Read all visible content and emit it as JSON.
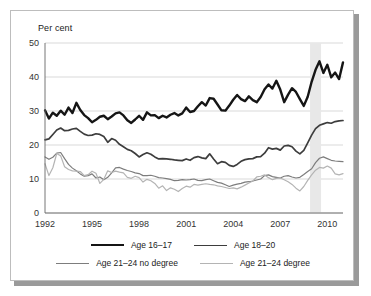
{
  "figure": {
    "axis_unit_label": "Per cent",
    "background_color": "#ffffff",
    "border_color": "#bdbdbd",
    "shadow_color": "#9a9a9a"
  },
  "legend": {
    "position": "bottom",
    "rows": [
      [
        {
          "label": "Age 16–17",
          "color": "#151515",
          "width": 2.4
        },
        {
          "label": "Age 18–20",
          "color": "#3d3d3d",
          "width": 1.7
        }
      ],
      [
        {
          "label": "Age 21–24 no degree",
          "color": "#7d7d7d",
          "width": 1.2
        },
        {
          "label": "Age 21–24 degree",
          "color": "#b4b4b4",
          "width": 1.2
        }
      ]
    ]
  },
  "chart_data": {
    "type": "line",
    "title": "",
    "subtitle": "",
    "xlabel": "",
    "ylabel": "Per cent",
    "ylim": [
      0,
      50
    ],
    "yticks": [
      0,
      10,
      20,
      30,
      40,
      50
    ],
    "xlim": [
      1992.0,
      2011.0
    ],
    "xticks": [
      1992,
      1995,
      1998,
      2001,
      2004,
      2007,
      2010
    ],
    "grid": true,
    "grid_color": "#c9c9c9",
    "legend_position": "bottom",
    "annotations": [
      {
        "type": "shaded-band",
        "name": "recession-band",
        "x_start": 2008.9,
        "x_end": 2009.6,
        "color": "#e8e8e8"
      }
    ],
    "x": [
      1992.0,
      1992.25,
      1992.5,
      1992.75,
      1993.0,
      1993.25,
      1993.5,
      1993.75,
      1994.0,
      1994.25,
      1994.5,
      1994.75,
      1995.0,
      1995.25,
      1995.5,
      1995.75,
      1996.0,
      1996.25,
      1996.5,
      1996.75,
      1997.0,
      1997.25,
      1997.5,
      1997.75,
      1998.0,
      1998.25,
      1998.5,
      1998.75,
      1999.0,
      1999.25,
      1999.5,
      1999.75,
      2000.0,
      2000.25,
      2000.5,
      2000.75,
      2001.0,
      2001.25,
      2001.5,
      2001.75,
      2002.0,
      2002.25,
      2002.5,
      2002.75,
      2003.0,
      2003.25,
      2003.5,
      2003.75,
      2004.0,
      2004.25,
      2004.5,
      2004.75,
      2005.0,
      2005.25,
      2005.5,
      2005.75,
      2006.0,
      2006.25,
      2006.5,
      2006.75,
      2007.0,
      2007.25,
      2007.5,
      2007.75,
      2008.0,
      2008.25,
      2008.5,
      2008.75,
      2009.0,
      2009.25,
      2009.5,
      2009.75,
      2010.0,
      2010.25,
      2010.5,
      2010.75,
      2011.0
    ],
    "series": [
      {
        "name": "Age 16–17",
        "color": "#151515",
        "width": 2.4,
        "values": [
          30.2,
          27.8,
          29.5,
          28.6,
          30.1,
          28.9,
          31.0,
          29.4,
          32.4,
          30.3,
          28.8,
          27.9,
          26.7,
          27.4,
          28.3,
          28.6,
          27.6,
          28.4,
          29.3,
          29.6,
          28.7,
          27.3,
          26.5,
          27.5,
          28.6,
          27.4,
          29.6,
          28.7,
          28.8,
          27.9,
          28.6,
          28.1,
          28.9,
          29.4,
          28.7,
          29.3,
          31.0,
          29.7,
          30.0,
          31.4,
          32.6,
          31.6,
          33.8,
          33.6,
          31.9,
          30.2,
          30.1,
          31.6,
          33.3,
          34.7,
          33.5,
          32.9,
          34.3,
          33.2,
          32.6,
          34.1,
          36.4,
          37.8,
          36.6,
          38.9,
          36.3,
          32.6,
          34.8,
          36.7,
          35.6,
          33.5,
          31.5,
          34.2,
          38.6,
          42.1,
          44.6,
          41.2,
          43.6,
          39.9,
          41.3,
          39.4,
          44.3
        ]
      },
      {
        "name": "Age 18–20",
        "color": "#3d3d3d",
        "width": 1.7,
        "values": [
          21.5,
          21.8,
          23.1,
          24.4,
          25.0,
          24.2,
          24.3,
          24.7,
          24.9,
          24.0,
          23.2,
          22.8,
          22.9,
          23.3,
          23.1,
          22.5,
          20.8,
          21.9,
          21.4,
          20.2,
          19.5,
          18.7,
          18.3,
          17.5,
          16.5,
          17.2,
          17.7,
          17.3,
          16.5,
          15.9,
          16.0,
          15.9,
          15.8,
          15.6,
          15.5,
          15.4,
          15.9,
          15.5,
          16.3,
          16.6,
          16.2,
          16.0,
          17.4,
          15.9,
          14.5,
          15.1,
          14.9,
          14.0,
          13.7,
          14.3,
          15.2,
          15.7,
          15.9,
          16.0,
          16.5,
          16.6,
          17.6,
          19.2,
          18.8,
          19.0,
          18.5,
          19.7,
          19.9,
          19.5,
          18.2,
          17.4,
          18.4,
          20.6,
          22.9,
          24.8,
          25.8,
          26.2,
          26.6,
          26.4,
          26.9,
          27.1,
          27.2
        ]
      },
      {
        "name": "Age 21–24 no degree",
        "color": "#7d7d7d",
        "width": 1.2,
        "values": [
          16.5,
          15.8,
          16.4,
          17.6,
          17.8,
          16.0,
          14.3,
          13.2,
          12.4,
          11.5,
          10.8,
          11.0,
          11.5,
          10.3,
          10.6,
          9.8,
          10.5,
          11.8,
          13.3,
          13.4,
          12.9,
          12.5,
          12.2,
          11.8,
          11.6,
          11.0,
          11.0,
          11.1,
          10.8,
          10.4,
          10.3,
          10.1,
          9.9,
          9.5,
          9.6,
          9.8,
          9.7,
          9.8,
          10.0,
          9.6,
          9.5,
          9.8,
          10.0,
          9.5,
          9.0,
          8.8,
          8.3,
          7.8,
          8.2,
          8.5,
          8.7,
          9.1,
          9.2,
          9.4,
          9.7,
          10.0,
          11.0,
          11.2,
          10.7,
          10.5,
          10.3,
          10.8,
          11.0,
          10.6,
          10.3,
          10.5,
          11.3,
          12.2,
          13.0,
          14.8,
          16.1,
          16.5,
          16.0,
          15.5,
          15.3,
          15.2,
          15.1
        ]
      },
      {
        "name": "Age 21–24 degree",
        "color": "#b4b4b4",
        "width": 1.2,
        "values": [
          14.5,
          11.0,
          13.3,
          17.5,
          16.8,
          13.6,
          12.8,
          12.4,
          12.3,
          12.2,
          11.0,
          11.3,
          12.3,
          11.7,
          8.7,
          9.9,
          12.4,
          11.9,
          12.3,
          12.0,
          11.8,
          10.5,
          10.2,
          10.8,
          10.4,
          9.1,
          9.9,
          9.5,
          8.7,
          7.3,
          8.0,
          6.6,
          7.4,
          7.0,
          6.3,
          7.2,
          7.9,
          7.6,
          8.4,
          8.2,
          8.4,
          8.6,
          8.4,
          8.3,
          8.0,
          7.8,
          7.5,
          7.2,
          7.4,
          7.1,
          7.6,
          8.2,
          8.8,
          9.4,
          10.6,
          10.8,
          11.2,
          10.4,
          9.8,
          10.2,
          10.3,
          9.8,
          9.2,
          8.4,
          7.3,
          6.5,
          7.8,
          9.6,
          11.2,
          12.6,
          13.4,
          13.2,
          13.8,
          13.2,
          11.5,
          11.2,
          11.6
        ]
      }
    ]
  }
}
